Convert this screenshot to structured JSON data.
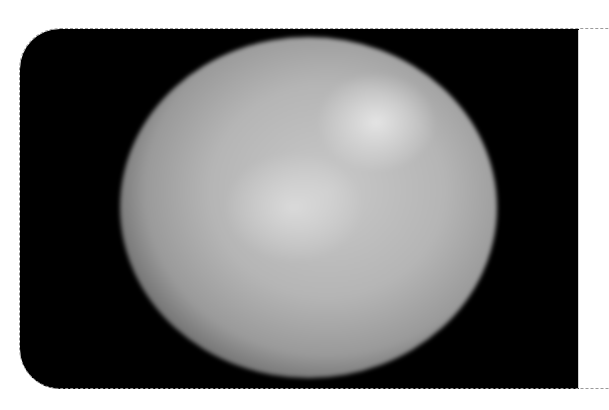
{
  "image": {
    "subject": "grayscale image of a spherical celestial body (planet/dwarf planet) against black space",
    "frame": {
      "background_color": "#000000",
      "border_style": "dashed",
      "border_color": "#9a9a9a",
      "corner_radius_left": 40
    },
    "planet": {
      "center": [
        308,
        207
      ],
      "radius_x": 188,
      "radius_y": 170,
      "base_color": "#b5b5b5",
      "highlight_color": "#ebebeb"
    }
  }
}
